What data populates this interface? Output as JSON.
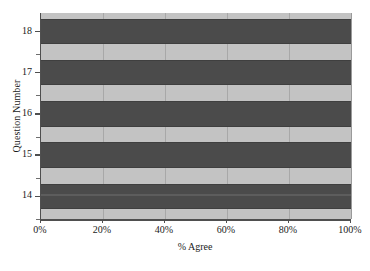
{
  "chart_data": {
    "type": "bar",
    "orientation": "horizontal",
    "title": "",
    "xlabel": "% Agree",
    "ylabel": "Question Number",
    "categories": [
      "14",
      "15",
      "16",
      "17",
      "18"
    ],
    "values": [
      100,
      100,
      100,
      100,
      100
    ],
    "series": [
      {
        "name": "% Agree",
        "values": [
          100,
          100,
          100,
          100,
          100
        ]
      }
    ],
    "xlim": [
      0,
      100
    ],
    "xticks": [
      0,
      20,
      40,
      60,
      80,
      100
    ],
    "xticklabels": [
      "0%",
      "20%",
      "40%",
      "60%",
      "80%",
      "100%"
    ],
    "yticklabels": [
      "18",
      "17",
      "16",
      "15",
      "14"
    ],
    "grid": "vertical",
    "legend": "none",
    "colors": {
      "bar": "#4b4b4b",
      "plot_background": "#c3c3c3",
      "gridline": "#a8a8a8",
      "axis": "#4f4f4f",
      "figure_background": "#ffffff",
      "text": "#1a1a1a"
    }
  }
}
